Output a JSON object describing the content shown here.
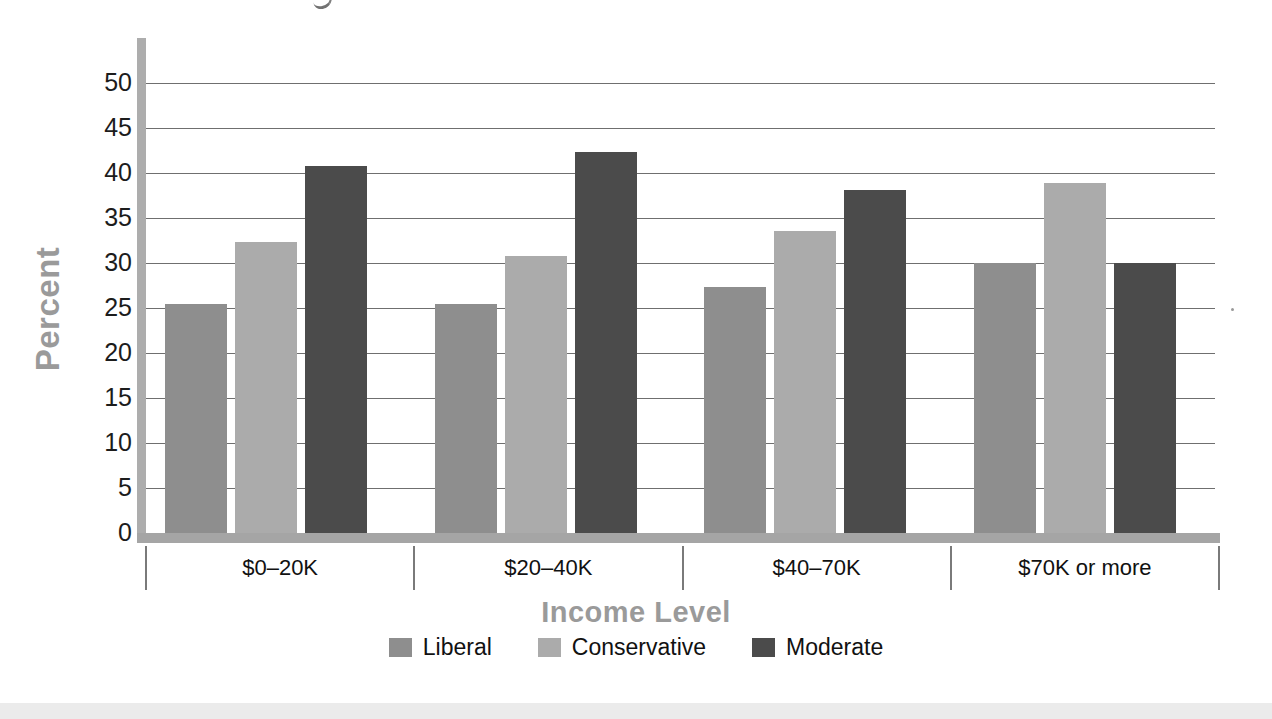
{
  "chart_data": {
    "type": "bar",
    "title": "",
    "xlabel": "Income Level",
    "ylabel": "Percent",
    "categories": [
      "$0–20K",
      "$20–40K",
      "$40–70K",
      "$70K or more"
    ],
    "series": [
      {
        "name": "Liberal",
        "color": "#8e8e8e",
        "values": [
          25.5,
          25.4,
          27.3,
          30.0
        ]
      },
      {
        "name": "Conservative",
        "color": "#ababab",
        "values": [
          32.3,
          30.8,
          33.6,
          38.9
        ]
      },
      {
        "name": "Moderate",
        "color": "#4b4b4b",
        "values": [
          40.8,
          42.3,
          38.1,
          30.0
        ]
      }
    ],
    "ylim": [
      0,
      50
    ],
    "ytick_labels": [
      "50",
      "45",
      "40",
      "35",
      "30",
      "25",
      "20",
      "15",
      "10",
      "5",
      "0"
    ],
    "ytick_values": [
      50,
      45,
      40,
      35,
      30,
      25,
      20,
      15,
      10,
      5,
      0
    ],
    "ytick_step": 5,
    "grid": true,
    "grid_axis": "y",
    "legend_position": "bottom-center",
    "legend_entries": [
      "Liberal",
      "Conservative",
      "Moderate"
    ]
  },
  "axes": {
    "y_title": "Percent",
    "x_title": "Income Level",
    "y_title_color": "#9a9a9a",
    "x_title_color": "#9a9a9a",
    "axis_line_color": "#a5a5a5",
    "gridline_color": "#6f6f6f",
    "tick_label_color": "#1c1c1c"
  },
  "legend": {
    "items": [
      {
        "label": "Liberal",
        "color": "#8e8e8e"
      },
      {
        "label": "Conservative",
        "color": "#ababab"
      },
      {
        "label": "Moderate",
        "color": "#4b4b4b"
      }
    ]
  }
}
